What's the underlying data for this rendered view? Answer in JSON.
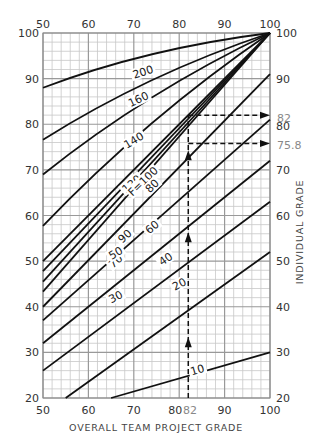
{
  "chart_data": {
    "type": "line",
    "title": "",
    "xlabel": "OVERALL TEAM PROJECT GRADE",
    "ylabel": "INDIVIDUAL GRADE",
    "xlim": [
      50,
      100
    ],
    "ylim": [
      20,
      100
    ],
    "x_ticks": [
      50,
      60,
      70,
      80,
      90,
      100
    ],
    "y_ticks": [
      20,
      30,
      40,
      50,
      60,
      70,
      80,
      90,
      100
    ],
    "grid": true,
    "grid_minor_step": 2,
    "grid_major_step": 10,
    "family_parameter": "F",
    "series": [
      {
        "name": "F=200",
        "label": "200",
        "x": [
          50,
          100
        ],
        "y": [
          88,
          100
        ]
      },
      {
        "name": "F=160",
        "label": "160",
        "x": [
          50,
          100
        ],
        "y": [
          76.6,
          100
        ]
      },
      {
        "name": "F=140",
        "label": "140",
        "x": [
          50,
          100
        ],
        "y": [
          69,
          100
        ]
      },
      {
        "name": "F=120",
        "label": "120",
        "x": [
          50,
          100
        ],
        "y": [
          57.7,
          100
        ]
      },
      {
        "name": "F=100",
        "label": "F=100",
        "x": [
          50,
          100
        ],
        "y": [
          50,
          100
        ]
      },
      {
        "name": "F=90",
        "label": "90",
        "x": [
          50,
          100
        ],
        "y": [
          47.8,
          100
        ]
      },
      {
        "name": "F=80",
        "label": "80",
        "x": [
          50,
          100
        ],
        "y": [
          45.5,
          100
        ]
      },
      {
        "name": "F=70",
        "label": "70",
        "x": [
          50,
          100
        ],
        "y": [
          43.3,
          100
        ]
      },
      {
        "name": "F=60",
        "label": "60",
        "x": [
          50,
          100
        ],
        "y": [
          40,
          91
        ]
      },
      {
        "name": "F=50",
        "label": "50",
        "x": [
          50,
          100
        ],
        "y": [
          37,
          81
        ]
      },
      {
        "name": "F=40",
        "label": "40",
        "x": [
          50,
          100
        ],
        "y": [
          32,
          72
        ]
      },
      {
        "name": "F=30",
        "label": "30",
        "x": [
          50,
          100
        ],
        "y": [
          26,
          63
        ]
      },
      {
        "name": "F=20",
        "label": "20",
        "x": [
          55,
          100
        ],
        "y": [
          20,
          52
        ]
      },
      {
        "name": "F=10",
        "label": "10",
        "x": [
          65,
          100
        ],
        "y": [
          20,
          30
        ]
      }
    ],
    "annotations": [
      {
        "type": "dashed-arrow",
        "description": "vertical from x=82 upward",
        "x": 82,
        "y_from": 20,
        "y_to": 82
      },
      {
        "type": "dashed-arrow",
        "description": "horizontal to right axis",
        "x_from": 82,
        "x_to": 100,
        "y": 82,
        "label": "82"
      },
      {
        "type": "dashed-arrow",
        "description": "horizontal to right axis",
        "x_from": 82,
        "x_to": 100,
        "y": 75.8,
        "label": "75.8"
      },
      {
        "type": "axis-marker",
        "axis": "x",
        "value": 82,
        "label": "82"
      }
    ]
  },
  "labels": {
    "x_axis_title": "OVERALL TEAM PROJECT GRADE",
    "y_axis_title_right": "INDIVIDUAL GRADE",
    "x_marker": "82",
    "right_marker_82": "82",
    "right_marker_758": "75.8",
    "top_ticks": [
      "50",
      "60",
      "70",
      "80",
      "90",
      "100"
    ],
    "bottom_ticks": [
      "50",
      "60",
      "70",
      "80",
      "90",
      "100"
    ],
    "left_ticks": [
      "100",
      "90",
      "80",
      "70",
      "60",
      "50",
      "40",
      "30",
      "20"
    ],
    "right_ticks": [
      "100",
      "90",
      "80",
      "70",
      "60",
      "50",
      "40",
      "30",
      "20"
    ]
  }
}
